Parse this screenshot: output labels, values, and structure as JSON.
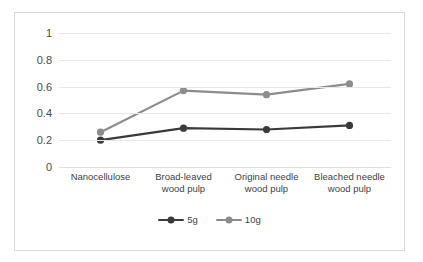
{
  "chart_data": {
    "type": "line",
    "title": "",
    "subtitle": "",
    "xlabel": "",
    "ylabel": "",
    "categories": [
      "Nanocellulose",
      "Broad-leaved wood pulp",
      "Original needle wood pulp",
      "Bleached needle wood pulp"
    ],
    "category_lines": [
      [
        "Nanocellulose"
      ],
      [
        "Broad-leaved",
        "wood pulp"
      ],
      [
        "Original needle",
        "wood pulp"
      ],
      [
        "Bleached needle",
        "wood pulp"
      ]
    ],
    "series": [
      {
        "name": "5g",
        "color": "#3a3a3a",
        "values": [
          0.2,
          0.29,
          0.28,
          0.31
        ]
      },
      {
        "name": "10g",
        "color": "#8c8c8c",
        "values": [
          0.26,
          0.57,
          0.54,
          0.62
        ]
      }
    ],
    "ylim": [
      0,
      1
    ],
    "yticks": [
      0,
      0.2,
      0.4,
      0.6,
      0.8,
      1
    ],
    "ytick_labels": [
      "0",
      "0.2",
      "0.4",
      "0.6",
      "0.8",
      "1"
    ],
    "grid": true,
    "grid_axis": "y",
    "legend_position": "bottom",
    "legend": [
      "5g",
      "10g"
    ]
  },
  "style": {
    "plot_background": "#ffffff",
    "border_color": "#d9d9d9",
    "gridline_color": "#e8e8e8",
    "tick_label_color": "#4a4a4a"
  }
}
